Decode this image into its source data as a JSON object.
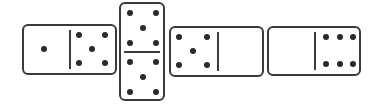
{
  "diagram": {
    "dominoes": [
      {
        "orientation": "horizontal",
        "halves": [
          1,
          5
        ]
      },
      {
        "orientation": "vertical",
        "halves": [
          5,
          5
        ]
      },
      {
        "orientation": "horizontal",
        "halves": [
          5,
          0
        ]
      },
      {
        "orientation": "horizontal",
        "halves": [
          0,
          6
        ]
      }
    ],
    "colors": {
      "stroke": "#3a3a3a",
      "pip": "#2a2a2a",
      "background": "#ffffff"
    }
  }
}
